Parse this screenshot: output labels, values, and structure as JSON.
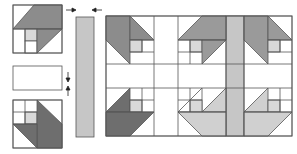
{
  "diagram": {
    "colors": {
      "outline": "#555555",
      "dark": "#7a7a7a",
      "medium": "#9a9a9a",
      "light": "#c4c4c4",
      "pale": "#d9d9d9",
      "sash_gray": "#b8b8b8",
      "white": "#ffffff"
    },
    "parts": {
      "top_unit": "Top half-block (flying sail) unit",
      "middle_strip": "Horizontal sashing strip",
      "bottom_unit": "Bottom half-block unit",
      "vertical_strip": "Vertical sashing strip",
      "arrows": [
        "arrow-right",
        "arrow-left",
        "arrow-down",
        "arrow-up"
      ]
    },
    "assembled": {
      "label": "Assembled quilt (2×2 blocks with sashing)",
      "rows": 2,
      "cols": 2
    }
  }
}
